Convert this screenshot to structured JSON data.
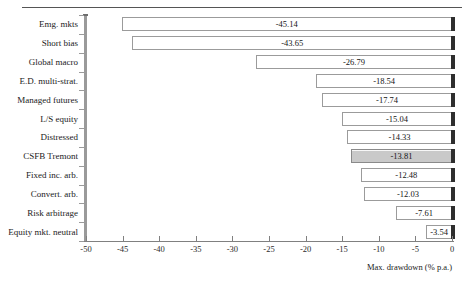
{
  "chart_data": {
    "type": "bar",
    "orientation": "horizontal",
    "title": "",
    "subtitle": "",
    "xlabel": "Max. drawdown (% p.a.)",
    "ylabel": "",
    "xlim": [
      -50,
      0
    ],
    "xticks": [
      -50,
      -45,
      -40,
      -35,
      -30,
      -25,
      -20,
      -15,
      -10,
      -5,
      0
    ],
    "xtick_labels": [
      "-50",
      "-45",
      "-40",
      "-35",
      "-30",
      "-25",
      "-20",
      "-15",
      "-10",
      "-5",
      "0"
    ],
    "grid": false,
    "legend": false,
    "categories": [
      "Emg. mkts",
      "Short bias",
      "Global macro",
      "E.D. multi-strat.",
      "Managed futures",
      "L/S equity",
      "Distressed",
      "CSFB Tremont",
      "Fixed inc. arb.",
      "Convert. arb.",
      "Risk arbitrage",
      "Equity mkt. neutral"
    ],
    "values": [
      -45.14,
      -43.65,
      -26.79,
      -18.54,
      -17.74,
      -15.04,
      -14.33,
      -13.81,
      -12.48,
      -12.03,
      -7.61,
      -3.54
    ],
    "value_labels": [
      "-45.14",
      "-43.65",
      "-26.79",
      "-18.54",
      "-17.74",
      "-15.04",
      "-14.33",
      "-13.81",
      "-12.48",
      "-12.03",
      "-7.61",
      "-3.54"
    ],
    "highlight_category": "CSFB Tremont",
    "highlight_index": 7,
    "colors": {
      "bar_fill": "#ffffff",
      "bar_border": "#9b9b9b",
      "bar_shadow": "#2e2e2e",
      "highlight_fill": "#c9c9c9",
      "axis": "#808080",
      "y_axis_spine": "#9a9a9a",
      "text": "#1a1a1a",
      "background": "#ffffff",
      "top_rule": "#555555"
    }
  }
}
